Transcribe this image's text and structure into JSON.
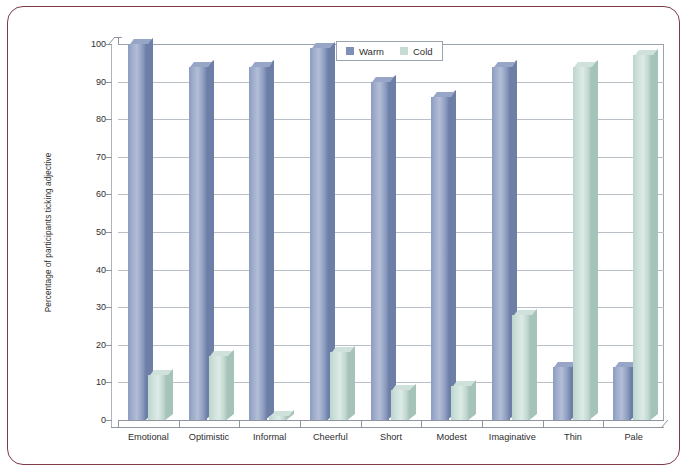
{
  "frame": {
    "border_color": "#7d3b47"
  },
  "chart_data": {
    "type": "bar",
    "title": "",
    "subtitle": "",
    "xlabel": "",
    "ylabel": "Percentage of participants ticking adjective",
    "ylim": [
      0,
      100
    ],
    "y_ticks": [
      0,
      10,
      20,
      30,
      40,
      50,
      60,
      70,
      80,
      90,
      100
    ],
    "grid": true,
    "grid_axis": "y",
    "legend_position": "top-center",
    "style": "3d-column",
    "categories": [
      "Emotional",
      "Optimistic",
      "Informal",
      "Cheerful",
      "Short",
      "Modest",
      "Imaginative",
      "Thin",
      "Pale"
    ],
    "series": [
      {
        "name": "Warm",
        "color": "#7f8fb5",
        "values": [
          100,
          94,
          94,
          99,
          90,
          86,
          94,
          14,
          14
        ]
      },
      {
        "name": "Cold",
        "color": "#c6dbd4",
        "values": [
          12,
          17,
          1,
          18,
          8,
          9,
          28,
          94,
          97
        ]
      }
    ]
  },
  "legend": {
    "entries": [
      {
        "label": "Warm",
        "color": "#7f8fb5"
      },
      {
        "label": "Cold",
        "color": "#c6dbd4"
      }
    ]
  }
}
